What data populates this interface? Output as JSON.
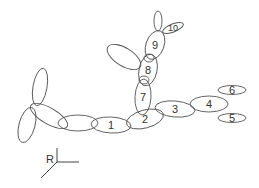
{
  "diagram": {
    "type": "ellipsoid chain schematic",
    "stroke_color": "#555555",
    "label_color": "#333333",
    "ellipses": [
      {
        "id": "left-top",
        "label": "",
        "cx": 40,
        "cy": 87,
        "rx": 7,
        "ry": 19,
        "rot": 10
      },
      {
        "id": "left-bottom",
        "label": "",
        "cx": 27,
        "cy": 125,
        "rx": 8,
        "ry": 18,
        "rot": 15
      },
      {
        "id": "left-branch",
        "label": "",
        "cx": 49,
        "cy": 116,
        "rx": 21,
        "ry": 8,
        "rot": 30
      },
      {
        "id": "unlabeled-chain",
        "label": "",
        "cx": 78,
        "cy": 123,
        "rx": 20,
        "ry": 8,
        "rot": 0
      },
      {
        "id": "e1",
        "label": "1",
        "cx": 111,
        "cy": 125,
        "rx": 20,
        "ry": 8,
        "rot": 3
      },
      {
        "id": "e2",
        "label": "2",
        "cx": 145,
        "cy": 119,
        "rx": 19,
        "ry": 9,
        "rot": -15
      },
      {
        "id": "e3",
        "label": "3",
        "cx": 175,
        "cy": 109,
        "rx": 20,
        "ry": 8,
        "rot": 5
      },
      {
        "id": "e4",
        "label": "4",
        "cx": 209,
        "cy": 104,
        "rx": 19,
        "ry": 8,
        "rot": 0
      },
      {
        "id": "e5",
        "label": "5",
        "cx": 232,
        "cy": 118,
        "rx": 14,
        "ry": 4.5,
        "rot": 0
      },
      {
        "id": "e6",
        "label": "6",
        "cx": 232,
        "cy": 90,
        "rx": 14,
        "ry": 4.5,
        "rot": 0
      },
      {
        "id": "e7",
        "label": "7",
        "cx": 143,
        "cy": 97,
        "rx": 8,
        "ry": 18,
        "rot": 3
      },
      {
        "id": "e8",
        "label": "8",
        "cx": 148,
        "cy": 70,
        "rx": 9,
        "ry": 16,
        "rot": 12
      },
      {
        "id": "e9",
        "label": "9",
        "cx": 155,
        "cy": 45,
        "rx": 9,
        "ry": 15,
        "rot": 20
      },
      {
        "id": "e10",
        "label": "10",
        "cx": 173,
        "cy": 28,
        "rx": 11,
        "ry": 4,
        "rot": -22
      },
      {
        "id": "top-small",
        "label": "",
        "cx": 158,
        "cy": 21,
        "rx": 4,
        "ry": 10,
        "rot": 0
      },
      {
        "id": "side-8",
        "label": "",
        "cx": 124,
        "cy": 57,
        "rx": 19,
        "ry": 9,
        "rot": 32
      },
      {
        "id": "junction-7-8",
        "label": "",
        "cx": 144,
        "cy": 80,
        "rx": 5,
        "ry": 4,
        "rot": 0
      },
      {
        "id": "junction-8-9",
        "label": "",
        "cx": 149,
        "cy": 58,
        "rx": 5,
        "ry": 4,
        "rot": 0
      }
    ],
    "axes": {
      "label": "R",
      "label_x": 50,
      "label_y": 159
    }
  }
}
